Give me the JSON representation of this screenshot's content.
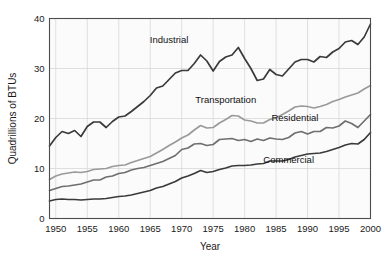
{
  "chart_data": {
    "type": "line",
    "title": "",
    "xlabel": "Year",
    "ylabel": "Quadrillions of BTUs",
    "xlim": [
      1949,
      2000
    ],
    "ylim": [
      0,
      40
    ],
    "xticks": [
      1950,
      1955,
      1960,
      1965,
      1970,
      1975,
      1980,
      1985,
      1990,
      1995,
      2000
    ],
    "yticks": [
      0,
      10,
      20,
      30,
      40
    ],
    "grid": true,
    "legend_position": "inline-annotations",
    "x": [
      1949,
      1950,
      1951,
      1952,
      1953,
      1954,
      1955,
      1956,
      1957,
      1958,
      1959,
      1960,
      1961,
      1962,
      1963,
      1964,
      1965,
      1966,
      1967,
      1968,
      1969,
      1970,
      1971,
      1972,
      1973,
      1974,
      1975,
      1976,
      1977,
      1978,
      1979,
      1980,
      1981,
      1982,
      1983,
      1984,
      1985,
      1986,
      1987,
      1988,
      1989,
      1990,
      1991,
      1992,
      1993,
      1994,
      1995,
      1996,
      1997,
      1998,
      1999,
      2000
    ],
    "series": [
      {
        "name": "Industrial",
        "color": "#3a3a3a",
        "linewidth": 1.7,
        "label_x": 1968,
        "label_y": 35.2,
        "values": [
          14.5,
          16.2,
          17.4,
          17.0,
          17.6,
          16.4,
          18.4,
          19.3,
          19.3,
          18.2,
          19.4,
          20.3,
          20.5,
          21.4,
          22.4,
          23.4,
          24.6,
          26.1,
          26.5,
          27.8,
          29.1,
          29.6,
          29.6,
          31.0,
          32.7,
          31.5,
          29.5,
          31.4,
          32.3,
          32.7,
          34.2,
          32.0,
          30.0,
          27.6,
          27.9,
          29.8,
          28.8,
          28.5,
          29.9,
          31.3,
          31.8,
          31.8,
          31.3,
          32.4,
          32.2,
          33.3,
          34.0,
          35.3,
          35.6,
          34.8,
          36.3,
          38.9
        ]
      },
      {
        "name": "Transportation",
        "color": "#9a9a9a",
        "linewidth": 1.7,
        "label_x": 1977,
        "label_y": 23.2,
        "values": [
          7.8,
          8.5,
          8.9,
          9.1,
          9.3,
          9.2,
          9.4,
          9.8,
          9.9,
          10.0,
          10.4,
          10.6,
          10.7,
          11.2,
          11.6,
          12.0,
          12.4,
          13.1,
          13.8,
          14.6,
          15.3,
          16.1,
          16.7,
          17.7,
          18.6,
          18.1,
          18.2,
          19.1,
          19.8,
          20.6,
          20.5,
          19.7,
          19.5,
          19.1,
          19.1,
          19.8,
          20.1,
          20.8,
          21.5,
          22.3,
          22.5,
          22.4,
          22.1,
          22.4,
          22.8,
          23.4,
          23.8,
          24.3,
          24.7,
          25.1,
          25.9,
          26.6
        ]
      },
      {
        "name": "Residential",
        "color": "#6f6f6f",
        "linewidth": 1.7,
        "label_x": 1988,
        "label_y": 19.6,
        "values": [
          5.6,
          6.0,
          6.4,
          6.5,
          6.7,
          6.9,
          7.3,
          7.7,
          7.7,
          8.3,
          8.5,
          9.0,
          9.2,
          9.7,
          10.0,
          10.2,
          10.6,
          11.0,
          11.4,
          12.0,
          12.6,
          13.8,
          14.1,
          14.9,
          15.0,
          14.6,
          14.8,
          15.8,
          15.9,
          16.0,
          15.6,
          15.8,
          15.4,
          15.9,
          15.6,
          16.1,
          15.9,
          15.8,
          16.2,
          17.1,
          17.4,
          16.9,
          17.4,
          17.4,
          18.2,
          18.1,
          18.5,
          19.5,
          19.0,
          18.2,
          19.5,
          20.8
        ]
      },
      {
        "name": "Commercial",
        "color": "#3a3a3a",
        "linewidth": 1.7,
        "label_x": 1987,
        "label_y": 11.2,
        "values": [
          3.5,
          3.8,
          3.9,
          3.8,
          3.8,
          3.7,
          3.8,
          3.9,
          3.9,
          4.0,
          4.2,
          4.4,
          4.5,
          4.7,
          5.0,
          5.3,
          5.6,
          6.1,
          6.4,
          6.9,
          7.4,
          8.1,
          8.5,
          9.0,
          9.6,
          9.2,
          9.4,
          9.8,
          10.1,
          10.5,
          10.6,
          10.6,
          10.7,
          10.9,
          11.0,
          11.5,
          11.5,
          11.5,
          11.8,
          12.3,
          12.6,
          12.9,
          13.0,
          13.1,
          13.4,
          13.8,
          14.2,
          14.7,
          15.0,
          14.9,
          15.8,
          17.2
        ]
      }
    ]
  },
  "axis": {
    "ylabel": "Quadrillions of BTUs",
    "xlabel": "Year",
    "yticks": [
      "0",
      "10",
      "20",
      "30",
      "40"
    ],
    "xticks": [
      "1950",
      "1955",
      "1960",
      "1965",
      "1970",
      "1975",
      "1980",
      "1985",
      "1990",
      "1995",
      "2000"
    ]
  }
}
